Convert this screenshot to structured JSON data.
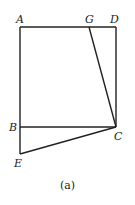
{
  "figure": {
    "caption": "(a)",
    "stroke_color": "#222222",
    "background": "#ffffff",
    "points": {
      "A": {
        "label": "A",
        "x": 20,
        "y": 27
      },
      "G": {
        "label": "G",
        "x": 89,
        "y": 27
      },
      "D": {
        "label": "D",
        "x": 116,
        "y": 27
      },
      "B": {
        "label": "B",
        "x": 20,
        "y": 127
      },
      "C": {
        "label": "C",
        "x": 116,
        "y": 127
      },
      "E": {
        "label": "E",
        "x": 20,
        "y": 154
      }
    },
    "segments": [
      "AD",
      "AE",
      "DC",
      "BC",
      "GC",
      "EC"
    ]
  }
}
